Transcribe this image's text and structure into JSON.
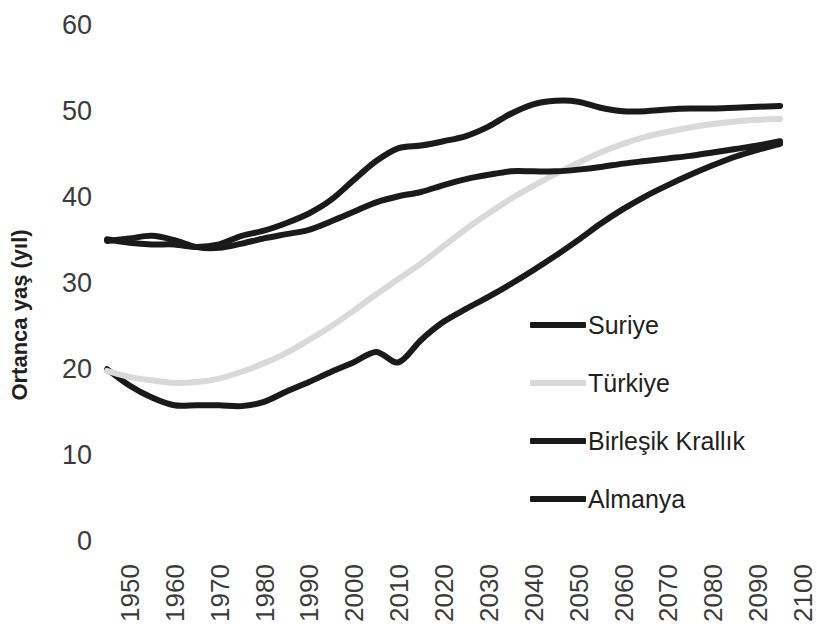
{
  "chart_data": {
    "type": "line",
    "title": "",
    "xlabel": "",
    "ylabel": "Ortanca yaş (yıl)",
    "xlim": [
      1950,
      2100
    ],
    "ylim": [
      0,
      60
    ],
    "grid": false,
    "legend_position": "center-right",
    "x": [
      1950,
      1955,
      1960,
      1965,
      1970,
      1975,
      1980,
      1985,
      1990,
      1995,
      2000,
      2005,
      2010,
      2015,
      2020,
      2025,
      2030,
      2035,
      2040,
      2045,
      2050,
      2055,
      2060,
      2065,
      2070,
      2075,
      2080,
      2085,
      2090,
      2095,
      2100
    ],
    "xticks": [
      "1950",
      "1960",
      "1970",
      "1980",
      "1990",
      "2000",
      "2010",
      "2020",
      "2030",
      "2040",
      "2050",
      "2060",
      "2070",
      "2080",
      "2090",
      "2100"
    ],
    "yticks": [
      "0",
      "10",
      "20",
      "30",
      "40",
      "50",
      "60"
    ],
    "series": [
      {
        "name": "Suriye",
        "color": "#1a1a1a",
        "values": [
          20.1,
          18.2,
          16.8,
          15.9,
          15.9,
          15.9,
          15.8,
          16.3,
          17.5,
          18.6,
          19.8,
          20.9,
          22.1,
          20.9,
          23.5,
          25.6,
          27.1,
          28.5,
          30.0,
          31.6,
          33.3,
          35.1,
          37.0,
          38.7,
          40.2,
          41.5,
          42.7,
          43.8,
          44.8,
          45.6,
          46.3
        ]
      },
      {
        "name": "Türkiye",
        "color": "#d9d9d9",
        "values": [
          19.9,
          19.2,
          18.8,
          18.5,
          18.6,
          19.0,
          19.8,
          20.8,
          22.0,
          23.5,
          25.1,
          26.9,
          28.8,
          30.6,
          32.4,
          34.4,
          36.4,
          38.2,
          39.9,
          41.4,
          42.8,
          44.1,
          45.3,
          46.3,
          47.1,
          47.7,
          48.2,
          48.6,
          48.9,
          49.1,
          49.2
        ]
      },
      {
        "name": "Birleşik Krallık",
        "color": "#1a1a1a",
        "values": [
          35.0,
          35.3,
          35.6,
          35.1,
          34.3,
          34.2,
          34.7,
          35.3,
          35.8,
          36.3,
          37.3,
          38.4,
          39.5,
          40.2,
          40.7,
          41.5,
          42.2,
          42.7,
          43.1,
          43.1,
          43.1,
          43.3,
          43.6,
          44.0,
          44.3,
          44.6,
          44.9,
          45.3,
          45.7,
          46.1,
          46.6
        ]
      },
      {
        "name": "Almanya",
        "color": "#1a1a1a",
        "values": [
          35.2,
          34.8,
          34.6,
          34.6,
          34.3,
          34.6,
          35.6,
          36.2,
          37.1,
          38.2,
          39.8,
          42.1,
          44.3,
          45.8,
          46.1,
          46.6,
          47.2,
          48.3,
          49.8,
          50.9,
          51.3,
          51.2,
          50.5,
          50.1,
          50.1,
          50.3,
          50.4,
          50.4,
          50.5,
          50.6,
          50.7
        ]
      }
    ]
  },
  "legend": {
    "items": [
      {
        "label": "Suriye",
        "color": "#1a1a1a"
      },
      {
        "label": "Türkiye",
        "color": "#d9d9d9"
      },
      {
        "label": "Birleşik Krallık",
        "color": "#1a1a1a"
      },
      {
        "label": "Almanya",
        "color": "#1a1a1a"
      }
    ]
  }
}
